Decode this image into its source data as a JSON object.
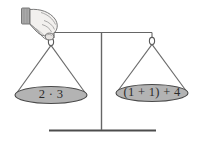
{
  "figure": {
    "background_color": "#ffffff",
    "line_color": "#555555",
    "pan_fill_color": "#b3b3b3",
    "pan_stroke_color": "#4a4a4a",
    "text_color": "#2b2b2b",
    "hand_fill_color": "#f2f0ee",
    "hand_stroke_color": "#6b6b6b",
    "cuff_fill_color": "#a9a9a9"
  },
  "scale": {
    "left_pan": {
      "label": "2 · 3",
      "name": "left-pan"
    },
    "right_pan": {
      "label": "(1 + 1) + 4",
      "name": "right-pan"
    },
    "beam": {
      "name": "balance-beam"
    },
    "post": {
      "name": "center-post"
    },
    "base": {
      "name": "base-bar"
    },
    "left_hook": {
      "name": "left-hook-ring"
    },
    "right_hook": {
      "name": "right-hook-ring"
    },
    "hand": {
      "name": "hand-holding-beam"
    }
  }
}
